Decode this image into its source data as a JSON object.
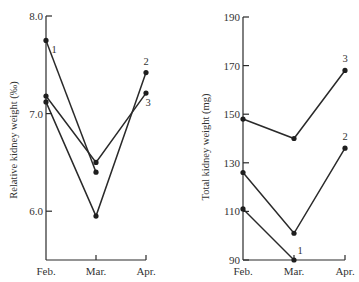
{
  "chart_data": [
    {
      "type": "line",
      "title": "",
      "xlabel": "",
      "ylabel": "Relative kidney weight (‰)",
      "categories": [
        "Feb.",
        "Mar.",
        "Apr."
      ],
      "ylim": [
        5.5,
        8.0
      ],
      "yticks": [
        6.0,
        7.0,
        8.0
      ],
      "ytick_labels": [
        "6.0",
        "7.0",
        "8.0"
      ],
      "grid": false,
      "legend": "inline series numbers",
      "series": [
        {
          "name": "1",
          "values": [
            7.75,
            6.4,
            null
          ]
        },
        {
          "name": "2",
          "values": [
            7.12,
            5.95,
            7.42
          ]
        },
        {
          "name": "3",
          "values": [
            7.18,
            6.5,
            7.21
          ]
        }
      ]
    },
    {
      "type": "line",
      "title": "",
      "xlabel": "",
      "ylabel": "Total kidney weight (mg)",
      "categories": [
        "Feb.",
        "Mar.",
        "Apr."
      ],
      "ylim": [
        90,
        190
      ],
      "yticks": [
        90,
        110,
        130,
        150,
        170,
        190
      ],
      "ytick_labels": [
        "90",
        "110",
        "130",
        "150",
        "170",
        "190"
      ],
      "grid": false,
      "legend": "inline series numbers",
      "series": [
        {
          "name": "1",
          "values": [
            111,
            90,
            null
          ]
        },
        {
          "name": "2",
          "values": [
            126,
            101,
            136
          ]
        },
        {
          "name": "3",
          "values": [
            148,
            140,
            168
          ]
        }
      ]
    }
  ],
  "panels": [
    {
      "ylabel": "Relative kidney weight (‰)",
      "x_labels": [
        "Feb.",
        "Mar.",
        "Apr."
      ],
      "series_labels": [
        "1",
        "2",
        "3"
      ]
    },
    {
      "ylabel": "Total kidney weight (mg)",
      "x_labels": [
        "Feb.",
        "Mar.",
        "Apr."
      ],
      "series_labels": [
        "1",
        "2",
        "3"
      ]
    }
  ]
}
